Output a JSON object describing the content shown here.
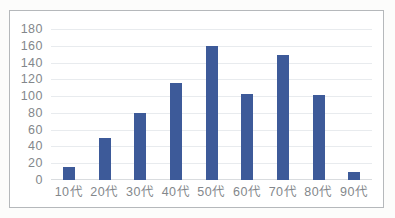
{
  "chart_data": {
    "type": "bar",
    "categories": [
      "10代",
      "20代",
      "30代",
      "40代",
      "50代",
      "60代",
      "70代",
      "80代",
      "90代"
    ],
    "values": [
      15,
      50,
      80,
      116,
      160,
      103,
      149,
      101,
      10
    ],
    "ylim": [
      0,
      180
    ],
    "ytick_step": 20,
    "ytick_labels": [
      "0",
      "20",
      "40",
      "60",
      "80",
      "100",
      "120",
      "140",
      "160",
      "180"
    ],
    "grid": true,
    "legend": false,
    "colors": {
      "bar": "#3D5A99",
      "gridline": "#E8EBEE",
      "axis_line": "#D9DCDF",
      "tick_label": "#83878B",
      "frame_border": "#B5B8BB",
      "chart_background": "#FFFFFF"
    }
  }
}
